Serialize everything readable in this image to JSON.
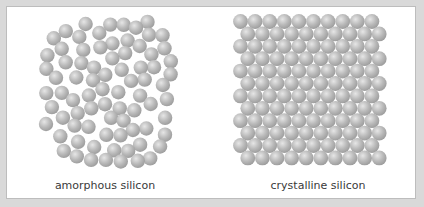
{
  "diagram": {
    "panels": [
      {
        "id": "amorphous",
        "caption": "amorphous silicon",
        "arrangement": "disordered",
        "approx_atom_count": 115
      },
      {
        "id": "crystalline",
        "caption": "crystalline silicon",
        "arrangement": "ordered-offset-grid",
        "rows": 12,
        "atoms_per_row": 10,
        "row_offset": "alternating half-pitch"
      }
    ],
    "colors": {
      "background": "#d9d9d9",
      "panel": "#ffffff",
      "panel_border": "#bdbdbd",
      "atom_light": "#e6e6e6",
      "atom_mid": "#b9b9b9",
      "atom_dark": "#9a9a9a",
      "caption_text": "#3a3a3a"
    }
  }
}
